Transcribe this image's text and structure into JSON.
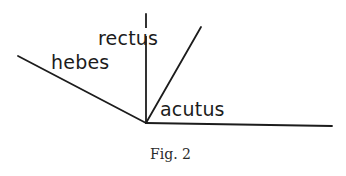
{
  "figure": {
    "caption": "Fig. 2",
    "labels": {
      "hebes": "hebes",
      "rectus": "rectus",
      "acutus": "acutus"
    },
    "vertex": {
      "x": 146,
      "y": 123
    },
    "rays": [
      {
        "name": "hebes",
        "x2": 18,
        "y2": 56
      },
      {
        "name": "rectus",
        "x2": 146,
        "y2": 14
      },
      {
        "name": "acutus",
        "x2": 201,
        "y2": 27
      },
      {
        "name": "base",
        "x2": 332,
        "y2": 126
      }
    ],
    "stroke_color": "#1c1c1c"
  }
}
